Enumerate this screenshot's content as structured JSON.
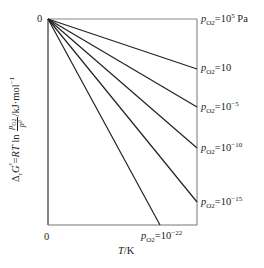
{
  "chart_data": {
    "type": "line",
    "title": "",
    "xlabel": "T/K",
    "ylabel": "ΔrGᶿ = RT ln (p_O2 / pᶿ) / kJ·mol⁻¹",
    "x_tick_labels": [
      "0"
    ],
    "y_tick_labels": [
      "0"
    ],
    "grid": false,
    "legend_position": "inline-right",
    "origin": {
      "x": 0,
      "y": 0
    },
    "series": [
      {
        "name": "p_O2 = 10^5 Pa",
        "label_main": "p",
        "label_sub": "O2",
        "label_eq": "=10",
        "label_sup": "5",
        "label_unit": " Pa",
        "end_px": [
          197,
          19
        ],
        "slope_note": "flat (0)"
      },
      {
        "name": "p_O2 = 10",
        "label_main": "p",
        "label_sub": "O2",
        "label_eq": "=10",
        "label_sup": "",
        "label_unit": "",
        "end_px": [
          197,
          69
        ]
      },
      {
        "name": "p_O2 = 10^-5",
        "label_main": "p",
        "label_sub": "O2",
        "label_eq": "=10",
        "label_sup": "−5",
        "label_unit": "",
        "end_px": [
          197,
          107
        ]
      },
      {
        "name": "p_O2 = 10^-10",
        "label_main": "p",
        "label_sub": "O2",
        "label_eq": "=10",
        "label_sup": "−10",
        "label_unit": "",
        "end_px": [
          197,
          148
        ]
      },
      {
        "name": "p_O2 = 10^-15",
        "label_main": "p",
        "label_sub": "O2",
        "label_eq": "=10",
        "label_sup": "−15",
        "label_unit": "",
        "end_px": [
          197,
          202
        ]
      },
      {
        "name": "p_O2 = 10^-22",
        "label_main": "p",
        "label_sub": "O2",
        "label_eq": "=10",
        "label_sup": "−22",
        "label_unit": "",
        "end_px": [
          160,
          225
        ]
      }
    ],
    "frame_px": {
      "left": 48,
      "top": 19,
      "right": 197,
      "bottom": 225
    }
  },
  "labels": {
    "y_zero": "0",
    "x_zero": "0",
    "x_axis_T": "T",
    "x_axis_unit": "/K",
    "y_axis_prefix": "Δ",
    "y_axis_r": "r",
    "y_axis_G": "G",
    "y_axis_theta": "ᶿ",
    "y_axis_eq": "=",
    "y_axis_RT": "RT",
    "y_axis_ln": " ln ",
    "y_axis_frac_num": "p",
    "y_axis_frac_num_sub": "O2",
    "y_axis_frac_den": "pᶿ",
    "y_axis_unit": "/kJ·mol",
    "y_axis_unit_sup": "−1"
  }
}
